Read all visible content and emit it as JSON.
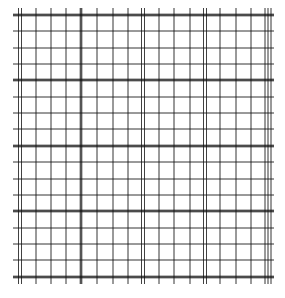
{
  "image": {
    "description": "Grid paper pattern with thin and emphasized lines",
    "width": 285,
    "height": 298,
    "background": "#ffffff",
    "line_color": "#111111"
  },
  "grid": {
    "x_min": 13,
    "x_max": 274,
    "y_min": 8,
    "y_max": 284,
    "horizontal_lines": [
      {
        "y": 15,
        "weight": "heavy"
      },
      {
        "y": 31,
        "weight": "thin"
      },
      {
        "y": 48,
        "weight": "thin"
      },
      {
        "y": 64,
        "weight": "thin"
      },
      {
        "y": 80,
        "weight": "heavy"
      },
      {
        "y": 97,
        "weight": "thin"
      },
      {
        "y": 113,
        "weight": "thin"
      },
      {
        "y": 129,
        "weight": "thin"
      },
      {
        "y": 146,
        "weight": "heavy"
      },
      {
        "y": 162,
        "weight": "thin"
      },
      {
        "y": 179,
        "weight": "thin"
      },
      {
        "y": 195,
        "weight": "thin"
      },
      {
        "y": 211,
        "weight": "heavy"
      },
      {
        "y": 228,
        "weight": "thin"
      },
      {
        "y": 244,
        "weight": "thin"
      },
      {
        "y": 260,
        "weight": "thin"
      },
      {
        "y": 277,
        "weight": "heavy"
      }
    ],
    "vertical_lines": [
      {
        "x": 20,
        "weight": "double"
      },
      {
        "x": 36,
        "weight": "thin"
      },
      {
        "x": 51,
        "weight": "thin"
      },
      {
        "x": 66,
        "weight": "thin"
      },
      {
        "x": 81,
        "weight": "heavy"
      },
      {
        "x": 97,
        "weight": "thin"
      },
      {
        "x": 113,
        "weight": "thin"
      },
      {
        "x": 128,
        "weight": "thin"
      },
      {
        "x": 143,
        "weight": "double"
      },
      {
        "x": 159,
        "weight": "thin"
      },
      {
        "x": 174,
        "weight": "thin"
      },
      {
        "x": 190,
        "weight": "thin"
      },
      {
        "x": 205,
        "weight": "double"
      },
      {
        "x": 220,
        "weight": "thin"
      },
      {
        "x": 236,
        "weight": "thin"
      },
      {
        "x": 251,
        "weight": "thin"
      },
      {
        "x": 268,
        "weight": "triple"
      }
    ]
  }
}
